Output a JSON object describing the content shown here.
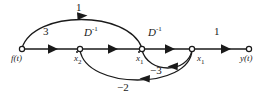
{
  "figure": {
    "type": "signal-flow-graph",
    "background": "#ffffff",
    "stroke_color": "#1a1a1a",
    "text_color": "#1a1a1a",
    "width": 277,
    "height": 98
  },
  "nodes": [
    {
      "id": "f",
      "label": "f(t)",
      "x": 22,
      "y": 49,
      "label_x": 13,
      "label_y": 58,
      "kind": "source"
    },
    {
      "id": "x2dot",
      "label": "x",
      "sub": "2",
      "x": 80,
      "y": 49,
      "label_x": 74,
      "label_y": 58,
      "kind": "internal"
    },
    {
      "id": "x1dot",
      "label": "x",
      "sub": "1",
      "x": 142,
      "y": 49,
      "label_x": 136,
      "label_y": 58,
      "kind": "internal"
    },
    {
      "id": "x1",
      "label": "x",
      "sub": "1",
      "x": 192,
      "y": 49,
      "label_x": 197,
      "label_y": 58,
      "kind": "internal"
    },
    {
      "id": "y",
      "label": "y(t)",
      "x": 249,
      "y": 49,
      "label_x": 241,
      "label_y": 58,
      "kind": "sink"
    }
  ],
  "edges": [
    {
      "id": "e-f-x2dot",
      "from": "f",
      "to": "x2dot",
      "gain": "3",
      "gain_x": 46,
      "gain_y": 32,
      "shape": "straight"
    },
    {
      "id": "e-x2dot-x1dot",
      "from": "x2dot",
      "to": "x1dot",
      "gain": "D",
      "gain_sup": "-1",
      "gain_x": 88,
      "gain_y": 31,
      "shape": "straight"
    },
    {
      "id": "e-x1dot-x1",
      "from": "x1dot",
      "to": "x1",
      "gain": "D",
      "gain_sup": "-1",
      "gain_x": 152,
      "gain_y": 31,
      "shape": "straight"
    },
    {
      "id": "e-x1-y",
      "from": "x1",
      "to": "y",
      "gain": "1",
      "gain_x": 216,
      "gain_y": 31,
      "shape": "straight"
    },
    {
      "id": "e-f-x1dot",
      "from": "f",
      "to": "x1dot",
      "gain": "1",
      "gain_x": 78,
      "gain_y": 5,
      "shape": "arc-above"
    },
    {
      "id": "e-x1-x1dot",
      "from": "x1",
      "to": "x1dot",
      "gain": "-3",
      "gain_x": 155,
      "gain_y": 66,
      "shape": "arc-below-inner"
    },
    {
      "id": "e-x1-x2dot",
      "from": "x1",
      "to": "x2dot",
      "gain": "-2",
      "gain_x": 122,
      "gain_y": 80,
      "shape": "arc-below-outer"
    }
  ],
  "labels": {
    "source_label": "f(t)",
    "sink_label": "y(t)",
    "state_dot_2": "x",
    "state_dot_1": "x",
    "state_1": "x",
    "subscript_2": "2",
    "subscript_1": "1",
    "integrator": "D",
    "integrator_exponent": "-1",
    "gain_three": "3",
    "gain_one_feedforward": "1",
    "gain_one_output": "1",
    "gain_minus_three": "−3",
    "gain_minus_two": "−2"
  }
}
